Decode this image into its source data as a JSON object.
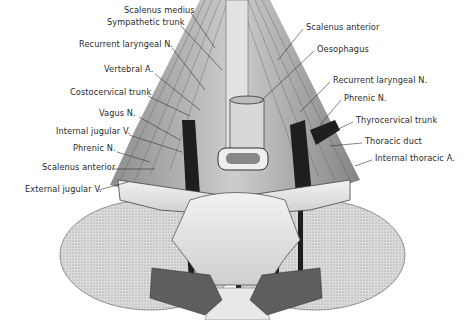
{
  "figure": {
    "labels_left": [
      {
        "text": "Scalenus medius",
        "x": 124,
        "y": 9
      },
      {
        "text": "Sympathetic trunk",
        "x": 107,
        "y": 21
      },
      {
        "text": "Recurrent laryngeal N.",
        "x": 79,
        "y": 43
      },
      {
        "text": "Vertebral A.",
        "x": 104,
        "y": 68
      },
      {
        "text": "Costocervical trunk",
        "x": 70,
        "y": 91
      },
      {
        "text": "Vagus N.",
        "x": 99,
        "y": 112
      },
      {
        "text": "Internal jugular V.",
        "x": 56,
        "y": 130
      },
      {
        "text": "Phrenic N.",
        "x": 73,
        "y": 146
      },
      {
        "text": "Scalenus anterior",
        "x": 42,
        "y": 165
      },
      {
        "text": "External jugular V.",
        "x": 25,
        "y": 187
      }
    ],
    "labels_right": [
      {
        "text": "Scalenus anterior",
        "x": 306,
        "y": 25
      },
      {
        "text": "Oesophagus",
        "x": 317,
        "y": 47
      },
      {
        "text": "Recurrent laryngeal N.",
        "x": 333,
        "y": 78
      },
      {
        "text": "Phrenic N.",
        "x": 344,
        "y": 96
      },
      {
        "text": "Thyrocervical trunk",
        "x": 356,
        "y": 118
      },
      {
        "text": "Thoracic duct",
        "x": 365,
        "y": 139
      },
      {
        "text": "Internal thoracic A.",
        "x": 375,
        "y": 156
      }
    ],
    "colors": {
      "background": "#ffffff",
      "label_text": "#2a2a2a",
      "leader_line": "#333333",
      "muscle": "#9a9a9a",
      "bone": "#e6e6e6",
      "vessel": "#1e1e1e",
      "pleura_stipple": "#c8c8c8"
    }
  }
}
